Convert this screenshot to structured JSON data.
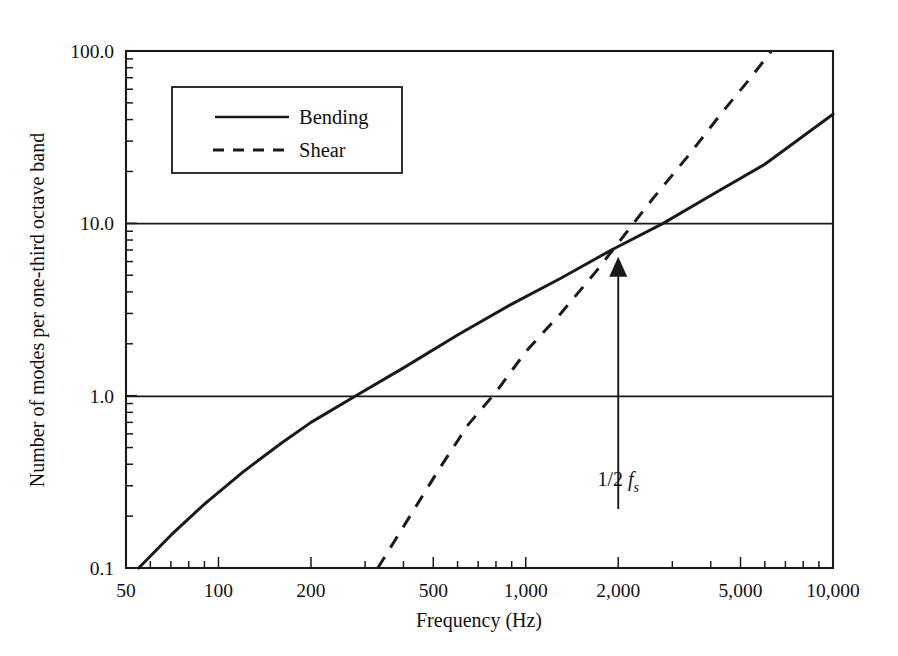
{
  "chart_data": {
    "type": "line",
    "title": "",
    "xlabel": "Frequency (Hz)",
    "ylabel": "Number of modes per one-third octave band",
    "xscale": "log",
    "yscale": "log",
    "xlim": [
      50,
      10000
    ],
    "ylim": [
      0.1,
      100
    ],
    "grid": "horizontal gridlines at y = 1.0 and y = 10.0",
    "legend_position": "upper left inside axes",
    "xticks": [
      50,
      100,
      200,
      500,
      1000,
      2000,
      5000,
      10000
    ],
    "xtick_labels": [
      "50",
      "100",
      "200",
      "500",
      "1,000",
      "2,000",
      "5,000",
      "10,000"
    ],
    "yticks": [
      0.1,
      1.0,
      10.0,
      100.0
    ],
    "ytick_labels": [
      "0.1",
      "1.0",
      "10.0",
      "100.0"
    ],
    "series": [
      {
        "name": "Bending",
        "style": "solid",
        "points": [
          [
            55,
            0.1
          ],
          [
            70,
            0.155
          ],
          [
            90,
            0.235
          ],
          [
            120,
            0.36
          ],
          [
            160,
            0.53
          ],
          [
            200,
            0.7
          ],
          [
            280,
            1.0
          ],
          [
            400,
            1.45
          ],
          [
            600,
            2.25
          ],
          [
            900,
            3.4
          ],
          [
            1300,
            4.8
          ],
          [
            1900,
            7.0
          ],
          [
            2800,
            10.0
          ],
          [
            4000,
            14.5
          ],
          [
            6000,
            22.0
          ],
          [
            10000,
            43.0
          ]
        ]
      },
      {
        "name": "Shear",
        "style": "dashed",
        "points": [
          [
            330,
            0.1
          ],
          [
            420,
            0.2
          ],
          [
            520,
            0.37
          ],
          [
            650,
            0.68
          ],
          [
            800,
            1.05
          ],
          [
            1000,
            1.8
          ],
          [
            1300,
            3.0
          ],
          [
            1700,
            5.3
          ],
          [
            2100,
            8.6
          ],
          [
            2600,
            14.0
          ],
          [
            3400,
            25.0
          ],
          [
            4400,
            45.0
          ],
          [
            5400,
            70.0
          ],
          [
            6300,
            100.0
          ]
        ]
      }
    ],
    "annotations": [
      {
        "name": "half-sampling-frequency",
        "label_plain": "1/2 fs",
        "label_prefix": "1/2 ",
        "label_symbol": "f",
        "label_subscript": "s",
        "x": 2000,
        "arrow_from_y": 0.22,
        "arrow_to_y": 6.4,
        "description": "vertical arrow at 2,000 Hz pointing up to the curve crossing"
      }
    ]
  },
  "legend": {
    "entries": [
      {
        "label": "Bending",
        "style": "solid"
      },
      {
        "label": "Shear",
        "style": "dashed"
      }
    ]
  },
  "axes": {
    "x_title": "Frequency (Hz)",
    "y_title": "Number of modes per one-third octave band",
    "x_tick_labels": [
      "50",
      "100",
      "200",
      "500",
      "1,000",
      "2,000",
      "5,000",
      "10,000"
    ],
    "y_tick_labels": [
      "0.1",
      "1.0",
      "10.0",
      "100.0"
    ]
  },
  "colors": {
    "ink": "#1a1a1a",
    "background": "#ffffff"
  }
}
